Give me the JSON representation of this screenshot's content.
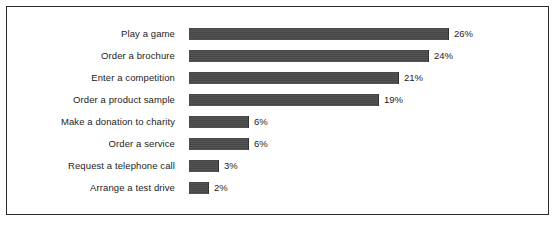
{
  "chart_data": {
    "type": "bar",
    "orientation": "horizontal",
    "title": "",
    "subtitle": "",
    "xlabel": "",
    "ylabel": "",
    "grid": false,
    "legend": null,
    "xlim": [
      0,
      26
    ],
    "axis_visible": false,
    "value_suffix": "%",
    "categories": [
      "Play  a game",
      "Order a brochure",
      "Enter a competition",
      "Order a product sample",
      "Make a donation to charity",
      "Order a service",
      "Request a telephone call",
      "Arrange a test drive"
    ],
    "values": [
      26,
      24,
      21,
      19,
      6,
      6,
      3,
      2
    ],
    "value_labels": [
      "26%",
      "24%",
      "21%",
      "19%",
      "6%",
      "6%",
      "3%",
      "2%"
    ],
    "bars": [
      {
        "label": "Play  a game",
        "value": 26,
        "value_label": "26%"
      },
      {
        "label": "Order a brochure",
        "value": 24,
        "value_label": "24%"
      },
      {
        "label": "Enter a competition",
        "value": 21,
        "value_label": "21%"
      },
      {
        "label": "Order a product sample",
        "value": 19,
        "value_label": "19%"
      },
      {
        "label": "Make a donation to charity",
        "value": 6,
        "value_label": "6%"
      },
      {
        "label": "Order a service",
        "value": 6,
        "value_label": "6%"
      },
      {
        "label": "Request a telephone call",
        "value": 3,
        "value_label": "3%"
      },
      {
        "label": "Arrange a test drive",
        "value": 2,
        "value_label": "2%"
      }
    ],
    "colors": {
      "bar_fill": "#4a4a4a",
      "bar_edge": "#333333",
      "text": "#1c1c1c",
      "frame_border": "#2b2b2b",
      "background": "#ffffff"
    }
  }
}
